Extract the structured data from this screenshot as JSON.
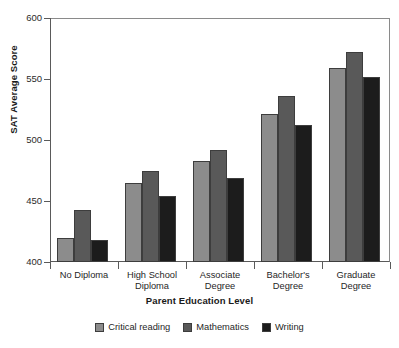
{
  "chart_data": {
    "type": "bar",
    "title": "",
    "xlabel": "Parent Education Level",
    "ylabel": "SAT Average Score",
    "ylim": [
      400,
      600
    ],
    "yticks": [
      400,
      450,
      500,
      550,
      600
    ],
    "ytick_labels": [
      "400",
      "450",
      "500",
      "550",
      "600"
    ],
    "grid": false,
    "legend_position": "bottom-center",
    "categories": [
      "No Diploma",
      "High School Diploma",
      "Associate Degree",
      "Bachelor's Degree",
      "Graduate Degree"
    ],
    "category_lines": [
      [
        "No Diploma"
      ],
      [
        "High School",
        "Diploma"
      ],
      [
        "Associate",
        "Degree"
      ],
      [
        "Bachelor's",
        "Degree"
      ],
      [
        "Graduate",
        "Degree"
      ]
    ],
    "series": [
      {
        "name": "Critical reading",
        "color": "#8c8c8c",
        "values": [
          420,
          465,
          483,
          521,
          559
        ]
      },
      {
        "name": "Mathematics",
        "color": "#595959",
        "values": [
          443,
          475,
          492,
          536,
          572
        ]
      },
      {
        "name": "Writing",
        "color": "#1c1c1c",
        "values": [
          418,
          454,
          469,
          512,
          552
        ]
      }
    ]
  },
  "legend": {
    "items": [
      {
        "label": "Critical reading",
        "color": "#8c8c8c"
      },
      {
        "label": "Mathematics",
        "color": "#595959"
      },
      {
        "label": "Writing",
        "color": "#1c1c1c"
      }
    ]
  },
  "axes": {
    "y_title": "SAT Average Score",
    "x_title": "Parent Education Level"
  },
  "colors": {
    "critical_reading": "#8c8c8c",
    "mathematics": "#595959",
    "writing": "#1c1c1c",
    "axis": "#5a5a5a",
    "background": "#ffffff"
  }
}
